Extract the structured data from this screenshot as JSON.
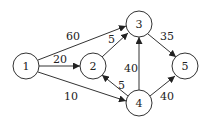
{
  "diagram": {
    "type": "directed-weighted-graph",
    "nodes": [
      {
        "id": "1",
        "label": "1",
        "x": 26,
        "y": 66
      },
      {
        "id": "2",
        "label": "2",
        "x": 93,
        "y": 66
      },
      {
        "id": "3",
        "label": "3",
        "x": 139,
        "y": 24
      },
      {
        "id": "4",
        "label": "4",
        "x": 139,
        "y": 103
      },
      {
        "id": "5",
        "label": "5",
        "x": 185,
        "y": 66
      }
    ],
    "edges": [
      {
        "from": "1",
        "to": "3",
        "weight": "60"
      },
      {
        "from": "1",
        "to": "2",
        "weight": "20"
      },
      {
        "from": "1",
        "to": "4",
        "weight": "10"
      },
      {
        "from": "2",
        "to": "3",
        "weight": "5"
      },
      {
        "from": "4",
        "to": "2",
        "weight": "5"
      },
      {
        "from": "4",
        "to": "3",
        "weight": "40"
      },
      {
        "from": "3",
        "to": "5",
        "weight": "35"
      },
      {
        "from": "4",
        "to": "5",
        "weight": "40"
      }
    ]
  }
}
